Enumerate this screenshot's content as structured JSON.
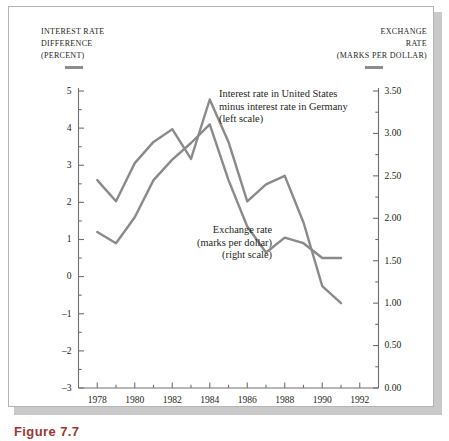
{
  "figure": {
    "caption": "Figure 7.7",
    "background_color": "#ffffff",
    "frame_color": "#b4b4b4",
    "shadow_color": "#c9c9c9"
  },
  "left_axis_header": {
    "line1": "Interest rate",
    "line2": "Difference",
    "line3": "(Percent)",
    "marker": "left-series-swatch"
  },
  "right_axis_header": {
    "line1": "Exchange",
    "line2": "Rate",
    "line3": "(Marks per dollar)",
    "marker": "right-series-swatch"
  },
  "annotations": [
    {
      "id": "interest-rate-annotation",
      "line1": "Interest rate in United States",
      "line2": "minus interest rate in Germany",
      "line3": "(left scale)"
    },
    {
      "id": "exchange-rate-annotation",
      "line1": "Exchange rate",
      "line2": "(marks per dollar)",
      "line3": "(right scale)"
    }
  ],
  "chart_data": {
    "type": "line",
    "title": "",
    "subtitle": "",
    "xlabel": "",
    "ylabel": "Interest rate difference (percent)",
    "y2label": "Exchange rate (marks per dollar)",
    "grid": false,
    "legend": "inline-annotations",
    "line_color": "#8a8a8a",
    "line_width": 2.4,
    "x": [
      1978,
      1979,
      1980,
      1981,
      1982,
      1983,
      1984,
      1985,
      1986,
      1987,
      1988,
      1989,
      1990,
      1991
    ],
    "xlim": [
      1977,
      1993
    ],
    "xticks": [
      1978,
      1980,
      1982,
      1984,
      1986,
      1988,
      1990,
      1992
    ],
    "xticklabels": [
      "1978",
      "1980",
      "1982",
      "1984",
      "1986",
      "1988",
      "1990",
      "1992"
    ],
    "xminorticks": [
      1977,
      1979,
      1981,
      1983,
      1985,
      1987,
      1989,
      1991,
      1993
    ],
    "ylim": [
      -3,
      5
    ],
    "yticks": [
      5,
      4,
      3,
      2,
      1,
      0,
      -1,
      -2,
      -3
    ],
    "yticklabels": [
      "5",
      "4",
      "3",
      "2",
      "1",
      "0",
      "–1",
      "–2",
      "–3"
    ],
    "yminorticks": [
      4.5,
      3.5,
      2.5,
      1.5,
      0.5,
      -0.5,
      -1.5,
      -2.5
    ],
    "y2lim": [
      0.0,
      3.5
    ],
    "y2ticks": [
      3.5,
      3.0,
      2.5,
      2.0,
      1.5,
      1.0,
      0.5,
      0.0
    ],
    "y2ticklabels": [
      "3.50",
      "3.00",
      "2.50",
      "2.00",
      "1.50",
      "1.00",
      "0.50",
      "0.00"
    ],
    "y2minorticks": [
      3.25,
      2.75,
      2.25,
      1.75,
      1.25,
      0.75,
      0.25
    ],
    "series": [
      {
        "name": "Interest rate in United States minus interest rate in Germany",
        "axis": "left",
        "units": "percent",
        "values": [
          1.2,
          0.9,
          1.6,
          2.6,
          3.15,
          3.6,
          4.1,
          2.6,
          1.35,
          0.65,
          1.05,
          0.9,
          0.5,
          0.5
        ]
      },
      {
        "name": "Exchange rate (marks per dollar)",
        "axis": "right",
        "units": "marks per dollar",
        "values": [
          2.45,
          2.2,
          2.65,
          2.9,
          3.05,
          2.7,
          3.4,
          2.9,
          2.2,
          2.4,
          2.5,
          1.95,
          1.2,
          1.0
        ]
      }
    ]
  }
}
